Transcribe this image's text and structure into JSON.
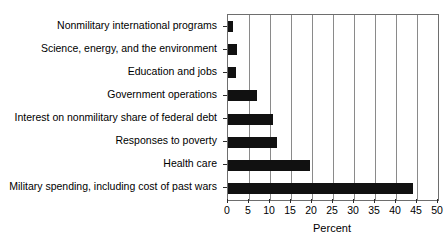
{
  "chart_data": {
    "type": "bar",
    "orientation": "horizontal",
    "title": "",
    "xlabel": "Percent",
    "ylabel": "",
    "xlim": [
      0,
      50
    ],
    "xticks": [
      0,
      5,
      10,
      15,
      20,
      25,
      30,
      35,
      40,
      45,
      50
    ],
    "xtick_labels": [
      "0",
      "5",
      "10",
      "15",
      "20",
      "25",
      "30",
      "35",
      "40",
      "45",
      "50"
    ],
    "grid": true,
    "legend": false,
    "bar_color": "#111111",
    "categories": [
      "Nonmilitary international programs",
      "Science, energy, and the environment",
      "Education and jobs",
      "Government operations",
      "Interest on nonmilitary share of federal debt",
      "Responses to poverty",
      "Health care",
      "Military spending, including cost of past wars"
    ],
    "values": [
      1.2,
      2.1,
      2.0,
      7.0,
      10.7,
      11.7,
      19.5,
      44.0
    ]
  }
}
